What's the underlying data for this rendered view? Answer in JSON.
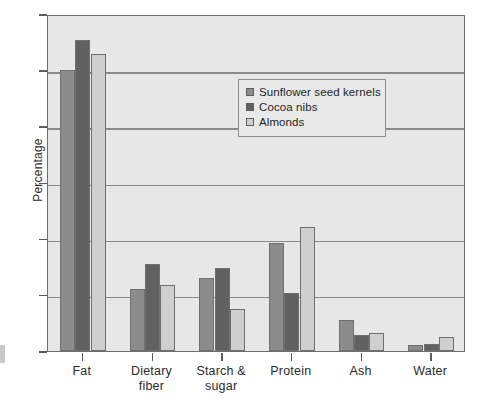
{
  "chart_data": {
    "type": "bar",
    "title": "",
    "xlabel": "",
    "ylabel": "Percentage",
    "ylim": [
      0,
      60
    ],
    "ytick_step": 10,
    "yticks": [
      0,
      10,
      20,
      30,
      40,
      50,
      60
    ],
    "ytick_labels": [
      "0",
      "10",
      "20",
      "30",
      "40",
      "50",
      "60"
    ],
    "grid": true,
    "grid_axis": "y",
    "legend_position": "upper center",
    "categories": [
      "Fat",
      "Dietary fiber",
      "Starch & sugar",
      "Protein",
      "Ash",
      "Water"
    ],
    "category_lines": [
      [
        "Fat"
      ],
      [
        "Dietary",
        "fiber"
      ],
      [
        "Starch &",
        "sugar"
      ],
      [
        "Protein"
      ],
      [
        "Ash"
      ],
      [
        "Water"
      ]
    ],
    "series": [
      {
        "name": "Sunflower seed kernels",
        "color": "#8c8c8c",
        "values": [
          50.0,
          11.1,
          13.0,
          19.2,
          5.5,
          1.1
        ]
      },
      {
        "name": "Cocoa nibs",
        "color": "#616161",
        "values": [
          55.3,
          15.5,
          14.7,
          10.3,
          2.9,
          1.3
        ]
      },
      {
        "name": "Almonds",
        "color": "#cfcfcf",
        "values": [
          52.8,
          11.8,
          7.4,
          22.0,
          3.2,
          2.5
        ]
      }
    ],
    "colors": {
      "plot_background": "#e7e7e7",
      "gridline": "#8a8a8a",
      "axis": "#6e6e6e",
      "bar_edge": "#6f6f6f",
      "legend_background": "#e9e9e9",
      "legend_border": "#8d8d8d",
      "text": "#2b2b2b"
    }
  }
}
